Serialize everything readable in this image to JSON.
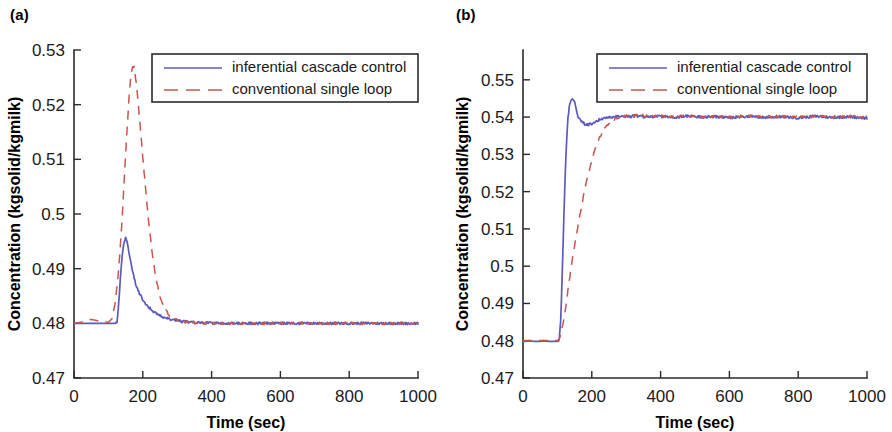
{
  "figure": {
    "panels": [
      {
        "label": "(a)",
        "name": "panel-a"
      },
      {
        "label": "(b)",
        "name": "panel-b"
      }
    ]
  },
  "chart_data": [
    {
      "type": "line",
      "panel": "(a)",
      "title": "",
      "xlabel": "Time (sec)",
      "ylabel": "Concentration (kgsolid/kgmilk)",
      "xlim": [
        0,
        1000
      ],
      "ylim": [
        0.47,
        0.53
      ],
      "xticks": [
        0,
        200,
        400,
        600,
        800,
        1000
      ],
      "xticklabels": [
        "0",
        "200",
        "400",
        "600",
        "800",
        "1000"
      ],
      "yticks": [
        0.47,
        0.48,
        0.49,
        0.5,
        0.51,
        0.52,
        0.53
      ],
      "yticklabels": [
        "0.47",
        "0.48",
        "0.49",
        "0.5",
        "0.51",
        "0.52",
        "0.53"
      ],
      "grid": false,
      "legend_position": "top-right-inside",
      "series": [
        {
          "name": "inferential cascade control",
          "color": "#5b5bbf",
          "style": "solid",
          "x": [
            0,
            20,
            40,
            60,
            80,
            100,
            110,
            120,
            125,
            130,
            135,
            140,
            145,
            150,
            155,
            160,
            165,
            170,
            175,
            180,
            190,
            200,
            210,
            220,
            230,
            240,
            250,
            260,
            270,
            280,
            290,
            300,
            320,
            340,
            360,
            380,
            400,
            440,
            480,
            520,
            560,
            600,
            650,
            700,
            750,
            800,
            850,
            900,
            950,
            1000
          ],
          "y": [
            0.48,
            0.48,
            0.48,
            0.48,
            0.48,
            0.48,
            0.48,
            0.48,
            0.4801,
            0.4835,
            0.4885,
            0.4925,
            0.4949,
            0.4956,
            0.4948,
            0.493,
            0.4912,
            0.4896,
            0.4882,
            0.4871,
            0.4855,
            0.4843,
            0.4834,
            0.4828,
            0.4822,
            0.4818,
            0.4814,
            0.4811,
            0.4809,
            0.4807,
            0.4806,
            0.4805,
            0.4803,
            0.4802,
            0.4801,
            0.4801,
            0.48005,
            0.48,
            0.48,
            0.48,
            0.48,
            0.48,
            0.48,
            0.48,
            0.48,
            0.48,
            0.48,
            0.48,
            0.48,
            0.48
          ]
        },
        {
          "name": "conventional single loop",
          "color": "#c8564f",
          "style": "dashed",
          "x": [
            0,
            20,
            40,
            50,
            60,
            80,
            100,
            110,
            120,
            130,
            140,
            150,
            160,
            165,
            170,
            175,
            180,
            190,
            200,
            210,
            220,
            230,
            240,
            250,
            260,
            280,
            300,
            320,
            340,
            360,
            380,
            400,
            440,
            480,
            520,
            560,
            600,
            650,
            700,
            750,
            800,
            850,
            900,
            950,
            1000
          ],
          "y": [
            0.48,
            0.4802,
            0.4806,
            0.4807,
            0.4806,
            0.4803,
            0.4802,
            0.4808,
            0.4838,
            0.49,
            0.499,
            0.511,
            0.5215,
            0.5252,
            0.5271,
            0.5268,
            0.5245,
            0.518,
            0.5105,
            0.5032,
            0.4968,
            0.4916,
            0.4876,
            0.4848,
            0.483,
            0.4812,
            0.4806,
            0.4803,
            0.4802,
            0.4801,
            0.48005,
            0.48,
            0.48,
            0.48,
            0.48,
            0.48,
            0.48,
            0.48,
            0.48,
            0.48,
            0.48,
            0.48,
            0.48,
            0.48,
            0.48
          ]
        }
      ],
      "legend": [
        {
          "label": "inferential cascade control",
          "color": "#5b5bbf",
          "style": "solid"
        },
        {
          "label": "conventional single loop",
          "color": "#c8564f",
          "style": "dashed"
        }
      ]
    },
    {
      "type": "line",
      "panel": "(b)",
      "title": "",
      "xlabel": "Time (sec)",
      "ylabel": "Concentration (kgsolid/kgmilk)",
      "xlim": [
        0,
        1000
      ],
      "ylim": [
        0.47,
        0.558
      ],
      "xticks": [
        0,
        200,
        400,
        600,
        800,
        1000
      ],
      "xticklabels": [
        "0",
        "200",
        "400",
        "600",
        "800",
        "1000"
      ],
      "yticks": [
        0.47,
        0.48,
        0.49,
        0.5,
        0.51,
        0.52,
        0.53,
        0.54,
        0.55
      ],
      "yticklabels": [
        "0.47",
        "0.48",
        "0.49",
        "0.5",
        "0.51",
        "0.52",
        "0.53",
        "0.54",
        "0.55"
      ],
      "grid": false,
      "legend_position": "top-right-inside",
      "series": [
        {
          "name": "inferential cascade control",
          "color": "#5b5bbf",
          "style": "solid",
          "x": [
            0,
            20,
            40,
            60,
            80,
            100,
            105,
            110,
            115,
            120,
            125,
            130,
            135,
            140,
            145,
            150,
            155,
            160,
            170,
            180,
            190,
            200,
            210,
            220,
            230,
            240,
            260,
            280,
            300,
            330,
            360,
            400,
            440,
            480,
            520,
            560,
            600,
            650,
            700,
            750,
            800,
            850,
            900,
            950,
            1000
          ],
          "y": [
            0.4798,
            0.4799,
            0.4798,
            0.4799,
            0.4798,
            0.4798,
            0.48,
            0.486,
            0.501,
            0.517,
            0.53,
            0.539,
            0.5432,
            0.5448,
            0.5452,
            0.544,
            0.542,
            0.5402,
            0.5388,
            0.5381,
            0.538,
            0.5382,
            0.5387,
            0.5392,
            0.5396,
            0.5398,
            0.54,
            0.5402,
            0.5401,
            0.5403,
            0.54,
            0.5402,
            0.5399,
            0.5403,
            0.54,
            0.5401,
            0.5398,
            0.5402,
            0.5399,
            0.5401,
            0.5398,
            0.5402,
            0.5399,
            0.5401,
            0.5397
          ]
        },
        {
          "name": "conventional single loop",
          "color": "#c8564f",
          "style": "dashed",
          "x": [
            0,
            20,
            40,
            60,
            80,
            100,
            105,
            110,
            120,
            130,
            140,
            150,
            160,
            170,
            180,
            190,
            200,
            210,
            220,
            230,
            240,
            250,
            260,
            270,
            280,
            300,
            330,
            360,
            400,
            440,
            480,
            520,
            560,
            600,
            650,
            700,
            750,
            800,
            850,
            900,
            950,
            1000
          ],
          "y": [
            0.48,
            0.4801,
            0.48,
            0.4801,
            0.48,
            0.4801,
            0.4803,
            0.4818,
            0.4862,
            0.493,
            0.4996,
            0.5056,
            0.511,
            0.516,
            0.5206,
            0.5248,
            0.5285,
            0.5315,
            0.534,
            0.5358,
            0.5372,
            0.5382,
            0.539,
            0.5396,
            0.54,
            0.5403,
            0.5405,
            0.5404,
            0.5403,
            0.5402,
            0.5404,
            0.5401,
            0.5403,
            0.54,
            0.5403,
            0.5401,
            0.5402,
            0.54,
            0.5403,
            0.5401,
            0.5402,
            0.54
          ]
        }
      ],
      "legend": [
        {
          "label": "inferential cascade control",
          "color": "#5b5bbf",
          "style": "solid"
        },
        {
          "label": "conventional single loop",
          "color": "#c8564f",
          "style": "dashed"
        }
      ]
    }
  ]
}
